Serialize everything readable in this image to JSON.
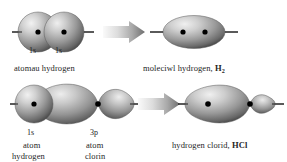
{
  "diagram": {
    "title_text": "",
    "background_color": "#ffffff",
    "axis_color": "#2b2b2b",
    "nucleus_color": "#000000",
    "orbital_fill_light": "#e8e8e8",
    "orbital_fill_mid": "#9a9a9a",
    "orbital_fill_dark": "#4a4a4a",
    "arrow_color_light": "#f0f0f0",
    "arrow_color_dark": "#707070"
  },
  "row1": {
    "left": {
      "orbital_labels": [
        "1s",
        "1s"
      ],
      "caption": "atomau hydrogen"
    },
    "arrow": {
      "name": "reaction-arrow"
    },
    "right": {
      "caption_text": "moleciwl hydrogen, ",
      "formula_symbol": "H",
      "formula_subscript": "2"
    }
  },
  "row2": {
    "left": {
      "orbital_labels": [
        "1s",
        "3p"
      ],
      "caption_left_line1": "atom",
      "caption_left_line2": "hydrogen",
      "caption_right_line1": "atom",
      "caption_right_line2": "clorin"
    },
    "arrow": {
      "name": "reaction-arrow"
    },
    "right": {
      "caption_text": "hydrogen clorid, ",
      "formula_symbol": "HCl"
    }
  }
}
